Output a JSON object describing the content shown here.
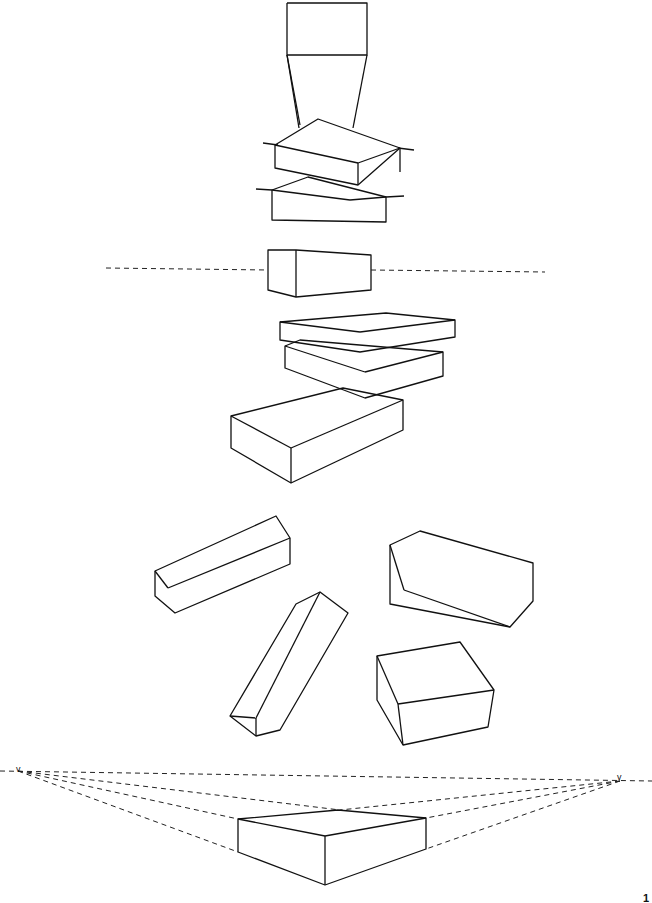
{
  "labels": {
    "vp_left": "v",
    "vp_right": "v",
    "page_number": "1"
  },
  "colors": {
    "line": "#111111",
    "background": "#ffffff"
  }
}
